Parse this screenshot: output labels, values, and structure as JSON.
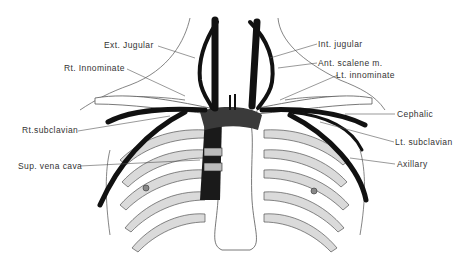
{
  "diagram": {
    "labels_left": [
      {
        "id": "ext-jugular",
        "text": "Ext. Jugular"
      },
      {
        "id": "rt-innominate",
        "text": "Rt. Innominate"
      },
      {
        "id": "rt-subclavian",
        "text": "Rt.subclavian"
      },
      {
        "id": "sup-vena-cava",
        "text": "Sup. vena cava"
      }
    ],
    "labels_right": [
      {
        "id": "int-jugular",
        "text": "Int. jugular"
      },
      {
        "id": "ant-scalene",
        "text": "Ant. scalene m."
      },
      {
        "id": "lt-innominate",
        "text": "Lt. innominate"
      },
      {
        "id": "cephalic",
        "text": "Cephalic"
      },
      {
        "id": "lt-subclavian",
        "text": "Lt. subclavian"
      },
      {
        "id": "axillary",
        "text": "Axillary"
      }
    ],
    "colors": {
      "vein": "#111111",
      "bone_shade": "#d8d8d8",
      "outline": "#444444",
      "leader": "#555555"
    }
  }
}
